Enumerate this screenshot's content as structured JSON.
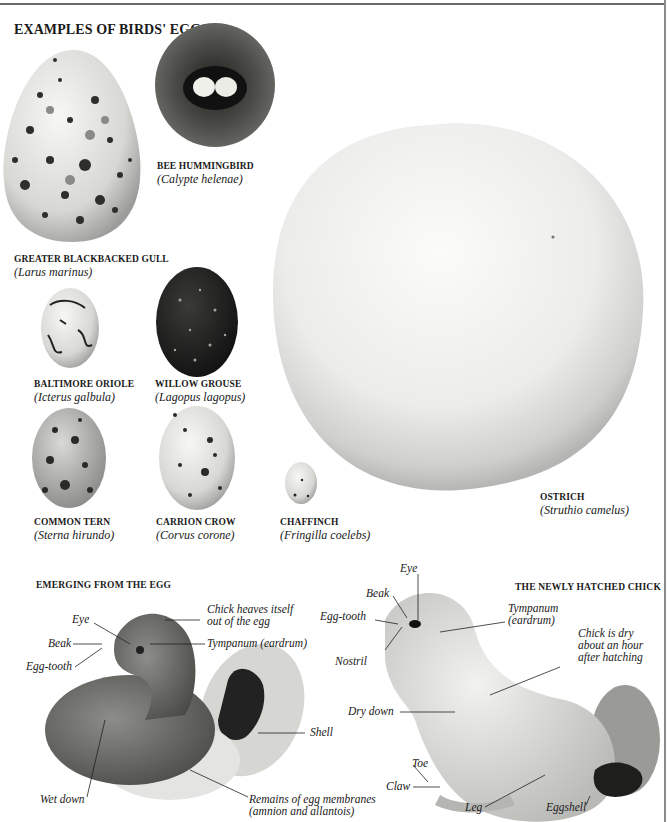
{
  "page": {
    "heading": "EXAMPLES OF BIRDS' EGGS",
    "colors": {
      "background": "#ffffff",
      "text": "#1a1a1a",
      "rule": "#6b6b6b"
    }
  },
  "eggs": [
    {
      "id": "gull",
      "common": "GREATER BLACKBACKED GULL",
      "latin": "(Larus marinus)"
    },
    {
      "id": "hummingbird",
      "common": "BEE HUMMINGBIRD",
      "latin": "(Calypte helenae)"
    },
    {
      "id": "oriole",
      "common": "BALTIMORE ORIOLE",
      "latin": "(Icterus galbula)"
    },
    {
      "id": "grouse",
      "common": "WILLOW GROUSE",
      "latin": "(Lagopus lagopus)"
    },
    {
      "id": "tern",
      "common": "COMMON TERN",
      "latin": "(Sterna hirundo)"
    },
    {
      "id": "crow",
      "common": "CARRION CROW",
      "latin": "(Corvus corone)"
    },
    {
      "id": "chaffinch",
      "common": "CHAFFINCH",
      "latin": "(Fringilla coelebs)"
    },
    {
      "id": "ostrich",
      "common": "OSTRICH",
      "latin": "(Struthio camelus)"
    }
  ],
  "emerging": {
    "title": "EMERGING FROM THE EGG",
    "labels": {
      "eye": "Eye",
      "beak": "Beak",
      "egg_tooth": "Egg-tooth",
      "heaves_1": "Chick heaves itself",
      "heaves_2": "out of the egg",
      "tympanum": "Tympanum (eardrum)",
      "shell": "Shell",
      "wet_down": "Wet down",
      "remains_1": "Remains of egg membranes",
      "remains_2": "(amnion and allantois)"
    }
  },
  "hatched": {
    "title": "THE NEWLY HATCHED CHICK",
    "labels": {
      "eye": "Eye",
      "beak": "Beak",
      "egg_tooth": "Egg-tooth",
      "nostril": "Nostril",
      "tympanum_1": "Tympanum",
      "tympanum_2": "(eardrum)",
      "dry_1": "Chick is dry",
      "dry_2": "about an hour",
      "dry_3": "after hatching",
      "dry_down": "Dry down",
      "toe": "Toe",
      "claw": "Claw",
      "leg": "Leg",
      "eggshell": "Eggshell"
    }
  }
}
